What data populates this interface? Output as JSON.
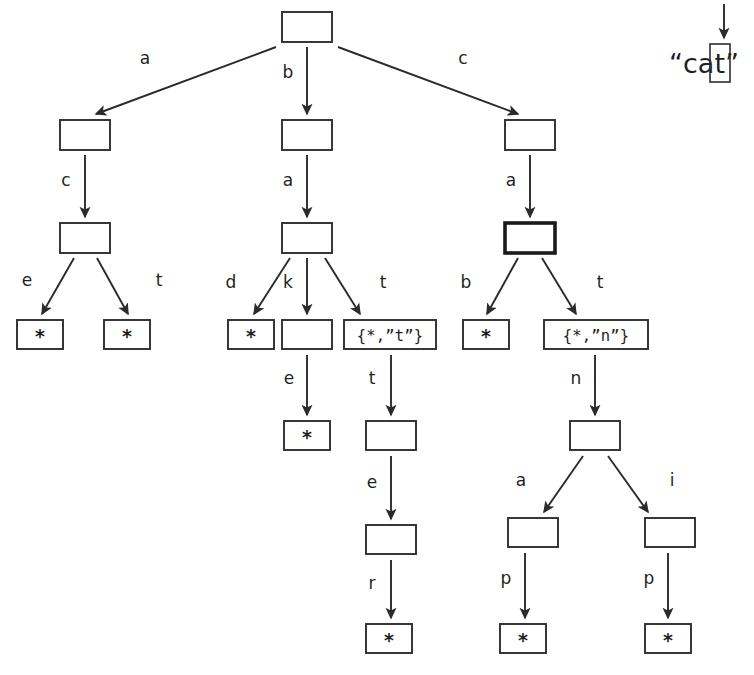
{
  "diagram": {
    "kind": "trie-search-diagram",
    "background": "#ffffff",
    "ink": "#2b2b2b",
    "input": {
      "text": "“cat”",
      "open_quote": "“",
      "close_quote": "”",
      "chars": [
        "c",
        "a",
        "t"
      ],
      "highlighted_char": "t",
      "highlighted_index": 2,
      "pointer_icon": "down-arrow-icon"
    },
    "node_label_empty": "",
    "node_label_star": "*",
    "node_label_set_t": "{*,”t”}",
    "node_label_set_n": "{*,”n”}",
    "nodes": [
      {
        "id": "root",
        "label": "",
        "kind": "empty",
        "x": 282,
        "y": 12,
        "w": 50,
        "h": 30,
        "emphasis": false
      },
      {
        "id": "n_a",
        "label": "",
        "kind": "empty",
        "x": 60,
        "y": 120,
        "w": 50,
        "h": 30,
        "emphasis": false
      },
      {
        "id": "n_b",
        "label": "",
        "kind": "empty",
        "x": 282,
        "y": 120,
        "w": 50,
        "h": 30,
        "emphasis": false
      },
      {
        "id": "n_c",
        "label": "",
        "kind": "empty",
        "x": 505,
        "y": 120,
        "w": 50,
        "h": 30,
        "emphasis": false
      },
      {
        "id": "n_ac",
        "label": "",
        "kind": "empty",
        "x": 60,
        "y": 223,
        "w": 50,
        "h": 30,
        "emphasis": false
      },
      {
        "id": "n_ba",
        "label": "",
        "kind": "empty",
        "x": 282,
        "y": 223,
        "w": 50,
        "h": 30,
        "emphasis": false
      },
      {
        "id": "n_ca",
        "label": "",
        "kind": "empty",
        "x": 505,
        "y": 223,
        "w": 50,
        "h": 30,
        "emphasis": true
      },
      {
        "id": "n_ace",
        "label": "*",
        "kind": "star",
        "x": 17,
        "y": 320,
        "w": 46,
        "h": 29,
        "emphasis": false
      },
      {
        "id": "n_act",
        "label": "*",
        "kind": "star",
        "x": 104,
        "y": 320,
        "w": 46,
        "h": 29,
        "emphasis": false
      },
      {
        "id": "n_bad",
        "label": "*",
        "kind": "star",
        "x": 228,
        "y": 320,
        "w": 46,
        "h": 29,
        "emphasis": false
      },
      {
        "id": "n_bak",
        "label": "",
        "kind": "empty",
        "x": 282,
        "y": 320,
        "w": 50,
        "h": 29,
        "emphasis": false
      },
      {
        "id": "n_bat",
        "label": "{*,”t”}",
        "kind": "set",
        "x": 344,
        "y": 320,
        "w": 92,
        "h": 29,
        "emphasis": false
      },
      {
        "id": "n_cab",
        "label": "*",
        "kind": "star",
        "x": 463,
        "y": 320,
        "w": 46,
        "h": 29,
        "emphasis": false
      },
      {
        "id": "n_cat",
        "label": "{*,”n”}",
        "kind": "set",
        "x": 544,
        "y": 320,
        "w": 104,
        "h": 29,
        "emphasis": false
      },
      {
        "id": "n_bake",
        "label": "*",
        "kind": "star",
        "x": 284,
        "y": 421,
        "w": 46,
        "h": 29,
        "emphasis": false
      },
      {
        "id": "n_batt",
        "label": "",
        "kind": "empty",
        "x": 366,
        "y": 421,
        "w": 50,
        "h": 29,
        "emphasis": false
      },
      {
        "id": "n_catn",
        "label": "",
        "kind": "empty",
        "x": 570,
        "y": 421,
        "w": 50,
        "h": 29,
        "emphasis": false
      },
      {
        "id": "n_batte",
        "label": "",
        "kind": "empty",
        "x": 366,
        "y": 525,
        "w": 50,
        "h": 29,
        "emphasis": false
      },
      {
        "id": "n_catna",
        "label": "",
        "kind": "empty",
        "x": 508,
        "y": 518,
        "w": 50,
        "h": 29,
        "emphasis": false
      },
      {
        "id": "n_catni",
        "label": "",
        "kind": "empty",
        "x": 645,
        "y": 518,
        "w": 50,
        "h": 29,
        "emphasis": false
      },
      {
        "id": "n_batter",
        "label": "*",
        "kind": "star",
        "x": 366,
        "y": 624,
        "w": 46,
        "h": 29,
        "emphasis": false
      },
      {
        "id": "n_catnap",
        "label": "*",
        "kind": "star",
        "x": 500,
        "y": 624,
        "w": 46,
        "h": 29,
        "emphasis": false
      },
      {
        "id": "n_catnip",
        "label": "*",
        "kind": "star",
        "x": 645,
        "y": 624,
        "w": 46,
        "h": 29,
        "emphasis": false
      }
    ],
    "edges": [
      {
        "id": "e_root_a",
        "label": "a",
        "from": "root",
        "to": "n_a",
        "x1": 276,
        "y1": 47,
        "x2": 96,
        "y2": 114,
        "lx": 145,
        "ly": 58
      },
      {
        "id": "e_root_b",
        "label": "b",
        "from": "root",
        "to": "n_b",
        "x1": 307,
        "y1": 47,
        "x2": 307,
        "y2": 114,
        "lx": 288,
        "ly": 72
      },
      {
        "id": "e_root_c",
        "label": "c",
        "from": "root",
        "to": "n_c",
        "x1": 338,
        "y1": 47,
        "x2": 518,
        "y2": 114,
        "lx": 463,
        "ly": 58
      },
      {
        "id": "e_a_c",
        "label": "c",
        "from": "n_a",
        "to": "n_ac",
        "x1": 85,
        "y1": 155,
        "x2": 85,
        "y2": 217,
        "lx": 66,
        "ly": 180
      },
      {
        "id": "e_b_a",
        "label": "a",
        "from": "n_b",
        "to": "n_ba",
        "x1": 307,
        "y1": 155,
        "x2": 307,
        "y2": 217,
        "lx": 288,
        "ly": 180
      },
      {
        "id": "e_c_a",
        "label": "a",
        "from": "n_c",
        "to": "n_ca",
        "x1": 530,
        "y1": 155,
        "x2": 530,
        "y2": 217,
        "lx": 511,
        "ly": 180
      },
      {
        "id": "e_ac_e",
        "label": "e",
        "from": "n_ac",
        "to": "n_ace",
        "x1": 74,
        "y1": 258,
        "x2": 42,
        "y2": 314,
        "lx": 27,
        "ly": 280
      },
      {
        "id": "e_ac_t",
        "label": "t",
        "from": "n_ac",
        "to": "n_act",
        "x1": 97,
        "y1": 258,
        "x2": 128,
        "y2": 314,
        "lx": 159,
        "ly": 280
      },
      {
        "id": "e_ba_d",
        "label": "d",
        "from": "n_ba",
        "to": "n_bad",
        "x1": 290,
        "y1": 258,
        "x2": 254,
        "y2": 314,
        "lx": 231,
        "ly": 282
      },
      {
        "id": "e_ba_k",
        "label": "k",
        "from": "n_ba",
        "to": "n_bak",
        "x1": 307,
        "y1": 258,
        "x2": 307,
        "y2": 314,
        "lx": 288,
        "ly": 282
      },
      {
        "id": "e_ba_t",
        "label": "t",
        "from": "n_ba",
        "to": "n_bat",
        "x1": 325,
        "y1": 258,
        "x2": 360,
        "y2": 314,
        "lx": 383,
        "ly": 282
      },
      {
        "id": "e_ca_b",
        "label": "b",
        "from": "n_ca",
        "to": "n_cab",
        "x1": 518,
        "y1": 258,
        "x2": 487,
        "y2": 314,
        "lx": 466,
        "ly": 282
      },
      {
        "id": "e_ca_t",
        "label": "t",
        "from": "n_ca",
        "to": "n_cat",
        "x1": 542,
        "y1": 258,
        "x2": 576,
        "y2": 314,
        "lx": 600,
        "ly": 282
      },
      {
        "id": "e_bak_e",
        "label": "e",
        "from": "n_bak",
        "to": "n_bake",
        "x1": 307,
        "y1": 355,
        "x2": 307,
        "y2": 415,
        "lx": 289,
        "ly": 378
      },
      {
        "id": "e_bat_t",
        "label": "t",
        "from": "n_bat",
        "to": "n_batt",
        "x1": 391,
        "y1": 355,
        "x2": 391,
        "y2": 415,
        "lx": 372,
        "ly": 378
      },
      {
        "id": "e_cat_n",
        "label": "n",
        "from": "n_cat",
        "to": "n_catn",
        "x1": 595,
        "y1": 355,
        "x2": 595,
        "y2": 415,
        "lx": 576,
        "ly": 378
      },
      {
        "id": "e_batt_e",
        "label": "e",
        "from": "n_batt",
        "to": "n_batte",
        "x1": 391,
        "y1": 456,
        "x2": 391,
        "y2": 519,
        "lx": 372,
        "ly": 482
      },
      {
        "id": "e_catn_a",
        "label": "a",
        "from": "n_catn",
        "to": "n_catna",
        "x1": 583,
        "y1": 456,
        "x2": 544,
        "y2": 512,
        "lx": 521,
        "ly": 480
      },
      {
        "id": "e_catn_i",
        "label": "i",
        "from": "n_catn",
        "to": "n_catni",
        "x1": 608,
        "y1": 456,
        "x2": 648,
        "y2": 512,
        "lx": 672,
        "ly": 480
      },
      {
        "id": "e_batte_r",
        "label": "r",
        "from": "n_batte",
        "to": "n_batter",
        "x1": 391,
        "y1": 560,
        "x2": 391,
        "y2": 618,
        "lx": 372,
        "ly": 583
      },
      {
        "id": "e_catna_p",
        "label": "p",
        "from": "n_catna",
        "to": "n_catnap",
        "x1": 525,
        "y1": 553,
        "x2": 525,
        "y2": 618,
        "lx": 506,
        "ly": 578
      },
      {
        "id": "e_catni_p",
        "label": "p",
        "from": "n_catni",
        "to": "n_catnip",
        "x1": 668,
        "y1": 553,
        "x2": 668,
        "y2": 618,
        "lx": 649,
        "ly": 578
      }
    ],
    "input_pointer": {
      "x1": 724,
      "y1": 4,
      "x2": 724,
      "y2": 38
    },
    "input_text_pos": {
      "x": 669,
      "y": 63
    },
    "cursor_rect": {
      "x": 710,
      "y": 44,
      "w": 20,
      "h": 38
    }
  }
}
